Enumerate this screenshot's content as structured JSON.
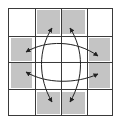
{
  "diagram": {
    "type": "grid-with-arrows",
    "rows": 4,
    "cols": 4,
    "grid_color": "#3a3a3a",
    "shade_color": "#c4c4c4",
    "arrow_color": "#222222",
    "shaded_cells": [
      {
        "row": 0,
        "col": 1
      },
      {
        "row": 0,
        "col": 2
      },
      {
        "row": 1,
        "col": 0
      },
      {
        "row": 2,
        "col": 0
      },
      {
        "row": 1,
        "col": 3
      },
      {
        "row": 2,
        "col": 3
      },
      {
        "row": 3,
        "col": 1
      },
      {
        "row": 3,
        "col": 2
      }
    ],
    "arrows": [
      {
        "name": "top-left-to-bottom-left",
        "description": "double-headed arc between top-middle and bottom-middle (left)"
      },
      {
        "name": "top-right-to-bottom-right",
        "description": "double-headed arc between top-middle and bottom-middle (right)"
      },
      {
        "name": "left-top-to-right-top",
        "description": "double-headed arc between left and right (upper)"
      },
      {
        "name": "left-bottom-to-right-bottom",
        "description": "double-headed arc between left and right (lower)"
      }
    ]
  }
}
